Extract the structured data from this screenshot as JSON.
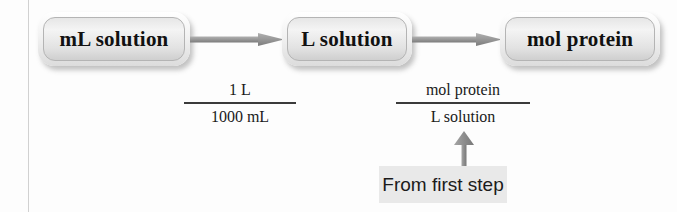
{
  "diagram": {
    "colors": {
      "background": "#fdfdfd",
      "arrow": "#8a8a8a",
      "box_border": "#b4b4b4",
      "text": "#111111",
      "annotation_background": "#e9e9e9",
      "margin_rule": "#c9c9c9"
    },
    "nodes": [
      {
        "id": "node-1",
        "label": "mL solution"
      },
      {
        "id": "node-2",
        "label": "L solution"
      },
      {
        "id": "node-3",
        "label": "mol protein"
      }
    ],
    "arrows": [
      {
        "id": "arrow-1",
        "from": "node-1",
        "to": "node-2",
        "direction": "right"
      },
      {
        "id": "arrow-2",
        "from": "node-2",
        "to": "node-3",
        "direction": "right"
      },
      {
        "id": "arrow-up",
        "from": "annotation",
        "to": "fraction-2",
        "direction": "up"
      }
    ],
    "conversion_factors": [
      {
        "id": "fraction-1",
        "numerator": "1 L",
        "denominator": "1000 mL"
      },
      {
        "id": "fraction-2",
        "numerator": "mol protein",
        "denominator": "L solution"
      }
    ],
    "annotation": {
      "label": "From first step",
      "points_to": "fraction-2"
    }
  }
}
